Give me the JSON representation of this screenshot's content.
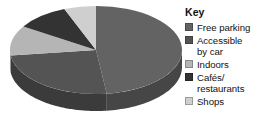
{
  "legend": {
    "title": "Key",
    "items": [
      {
        "label": "Free parking",
        "color": "#636363"
      },
      {
        "label": "Accessible\nby car",
        "color": "#545454"
      },
      {
        "label": "Indoors",
        "color": "#b5b5b5"
      },
      {
        "label": "Cafés/\nrestaurants",
        "color": "#333333"
      },
      {
        "label": "Shops",
        "color": "#cfcfcf"
      }
    ]
  },
  "chart_data": {
    "type": "pie",
    "title": "",
    "three_d": true,
    "legend_position": "right",
    "legend_title": "Key",
    "categories": [
      "Free parking",
      "Accessible by car",
      "Indoors",
      "Cafés/restaurants",
      "Shops"
    ],
    "values": [
      48,
      25,
      11,
      10,
      6
    ],
    "unit": "percent",
    "colors": [
      "#636363",
      "#545454",
      "#b5b5b5",
      "#333333",
      "#cfcfcf"
    ],
    "side_colors": [
      "#464646",
      "#3b3b3b",
      "#808080",
      "#242424",
      "#969696"
    ],
    "start_angle_deg": 0,
    "direction": "clockwise"
  }
}
